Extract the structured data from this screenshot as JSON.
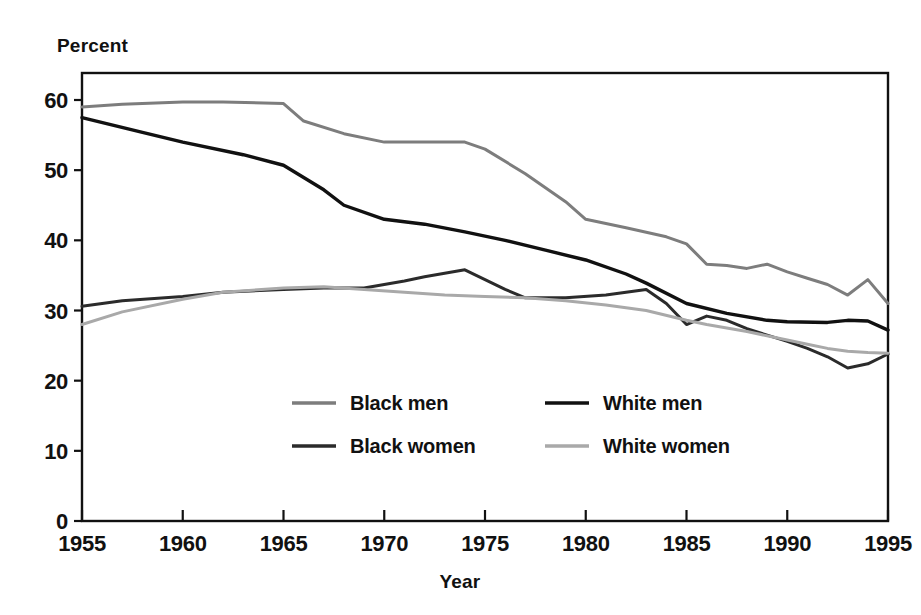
{
  "chart_data": {
    "type": "line",
    "title": "",
    "xlabel": "Year",
    "ylabel": "Percent",
    "xlim": [
      1955,
      1995
    ],
    "ylim": [
      0,
      63
    ],
    "grid": false,
    "legend_position": "inside-bottom-center",
    "x_ticks": [
      1955,
      1960,
      1965,
      1970,
      1975,
      1980,
      1985,
      1990,
      1995
    ],
    "x_tick_labels": [
      "1955",
      "1960",
      "1965",
      "1970",
      "1975",
      "1980",
      "1985",
      "1990",
      "1995"
    ],
    "y_ticks": [
      0,
      10,
      20,
      30,
      40,
      50,
      60
    ],
    "y_tick_labels": [
      "0",
      "10",
      "20",
      "30",
      "40",
      "50",
      "60"
    ],
    "series": [
      {
        "name": "Black men",
        "color": "#7d7d7d",
        "stroke_width": 3.0,
        "x": [
          1955,
          1957,
          1960,
          1962,
          1965,
          1966,
          1968,
          1970,
          1972,
          1974,
          1975,
          1977,
          1979,
          1980,
          1982,
          1984,
          1985,
          1986,
          1987,
          1988,
          1989,
          1990,
          1991,
          1992,
          1993,
          1994,
          1995
        ],
        "values": [
          59.0,
          59.4,
          59.7,
          59.7,
          59.5,
          57.0,
          55.2,
          54.0,
          54.0,
          54.0,
          53.0,
          49.5,
          45.5,
          43.0,
          41.8,
          40.5,
          39.5,
          36.6,
          36.4,
          36.0,
          36.6,
          35.5,
          34.6,
          33.7,
          32.2,
          34.4,
          31.0
        ]
      },
      {
        "name": "Black women",
        "color": "#2b2b2b",
        "stroke_width": 3.0,
        "x": [
          1955,
          1957,
          1960,
          1962,
          1965,
          1967,
          1969,
          1971,
          1972,
          1974,
          1976,
          1977,
          1979,
          1981,
          1982,
          1983,
          1984,
          1985,
          1986,
          1987,
          1988,
          1990,
          1991,
          1992,
          1993,
          1994,
          1995
        ],
        "values": [
          30.6,
          31.4,
          32.0,
          32.6,
          33.0,
          33.2,
          33.2,
          34.2,
          34.8,
          35.8,
          33.0,
          31.8,
          31.8,
          32.2,
          32.6,
          33.0,
          31.0,
          28.0,
          29.2,
          28.6,
          27.4,
          25.6,
          24.6,
          23.4,
          21.8,
          22.4,
          23.8
        ]
      },
      {
        "name": "White men",
        "color": "#111111",
        "stroke_width": 3.4,
        "x": [
          1955,
          1958,
          1960,
          1963,
          1965,
          1967,
          1968,
          1970,
          1972,
          1974,
          1976,
          1978,
          1980,
          1982,
          1983,
          1985,
          1987,
          1989,
          1990,
          1992,
          1993,
          1994,
          1995
        ],
        "values": [
          57.5,
          55.4,
          54.0,
          52.2,
          50.7,
          47.2,
          45.0,
          43.0,
          42.3,
          41.2,
          40.0,
          38.6,
          37.2,
          35.2,
          33.9,
          31.0,
          29.6,
          28.6,
          28.4,
          28.3,
          28.6,
          28.5,
          27.2
        ]
      },
      {
        "name": "White women",
        "color": "#a9a9a9",
        "stroke_width": 3.0,
        "x": [
          1955,
          1957,
          1960,
          1962,
          1965,
          1967,
          1969,
          1971,
          1973,
          1975,
          1977,
          1979,
          1981,
          1983,
          1985,
          1986,
          1988,
          1990,
          1991,
          1992,
          1993,
          1994,
          1995
        ],
        "values": [
          28.0,
          29.8,
          31.6,
          32.6,
          33.2,
          33.4,
          33.0,
          32.6,
          32.2,
          32.0,
          31.8,
          31.4,
          30.8,
          30.0,
          28.6,
          28.0,
          27.0,
          25.8,
          25.2,
          24.6,
          24.2,
          24.0,
          23.9
        ]
      }
    ]
  },
  "legend": {
    "entries": [
      {
        "label": "Black men",
        "color": "#7d7d7d"
      },
      {
        "label": "White men",
        "color": "#111111"
      },
      {
        "label": "Black women",
        "color": "#2b2b2b"
      },
      {
        "label": "White women",
        "color": "#a9a9a9"
      }
    ]
  },
  "labels": {
    "y_axis_title": "Percent",
    "x_axis_title": "Year"
  }
}
